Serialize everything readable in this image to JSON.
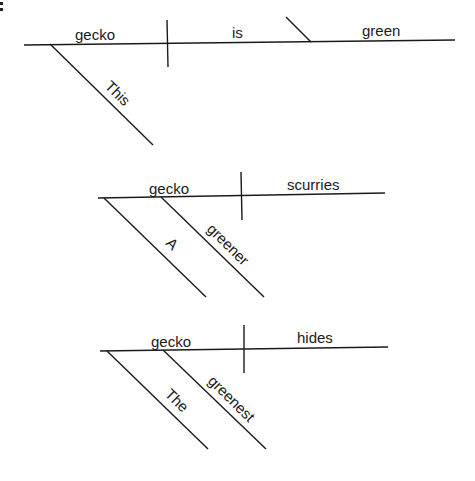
{
  "corner_mark": ":",
  "diagrams": [
    {
      "sentence": "This gecko is green",
      "subject": "gecko",
      "verb": "is",
      "complement": "green",
      "modifiers": [
        "This"
      ]
    },
    {
      "sentence": "A greener gecko scurries",
      "subject": "gecko",
      "verb": "scurries",
      "modifiers": [
        "A",
        "greener"
      ]
    },
    {
      "sentence": "The greenest gecko hides",
      "subject": "gecko",
      "verb": "hides",
      "modifiers": [
        "The",
        "greenest"
      ]
    }
  ]
}
